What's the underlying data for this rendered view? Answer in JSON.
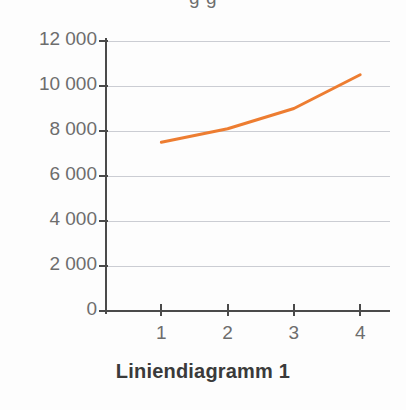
{
  "chart_data": {
    "type": "line",
    "title": "",
    "caption": "Liniendiagramm 1",
    "xlabel": "",
    "ylabel": "",
    "x": [
      1,
      2,
      3,
      4
    ],
    "categories": [
      "1",
      "2",
      "3",
      "4"
    ],
    "series": [
      {
        "name": "Datenreihe 1",
        "color": "#ED7D31",
        "values": [
          7500,
          8100,
          9000,
          10500
        ]
      }
    ],
    "xlim": [
      0.15,
      4.45
    ],
    "ylim": [
      0,
      12000
    ],
    "ytick_values": [
      12000,
      10000,
      8000,
      6000,
      4000,
      2000,
      0
    ],
    "ytick_labels": [
      "12 000",
      "10 000",
      "8 000",
      "6 000",
      "4 000",
      "2 000",
      "0"
    ],
    "xtick_values": [
      1,
      2,
      3,
      4
    ],
    "xtick_labels": [
      "1",
      "2",
      "3",
      "4"
    ],
    "grid": true,
    "grid_color": "#b9bcc4",
    "axis_color": "#4a4a4a",
    "tick_label_color": "#6d6d6d",
    "legend": false,
    "legend_position": "none",
    "background_color": "#fdfdfd"
  },
  "figure": {
    "clipped_title_text": "g                              g",
    "caption_text": "Liniendiagramm 1"
  }
}
